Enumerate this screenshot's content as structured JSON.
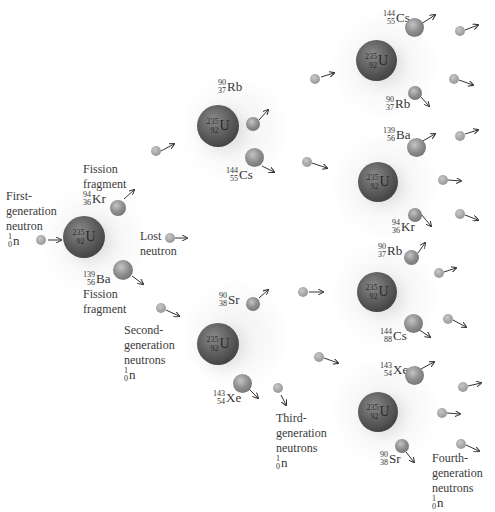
{
  "diagram": {
    "type": "nuclear-fission-chain-reaction",
    "uranium": {
      "mass": "235",
      "atomic": "92",
      "symbol": "U"
    },
    "neutron": {
      "mass": "1",
      "atomic": "0",
      "symbol": "n"
    },
    "labels": {
      "first_gen": [
        "First-",
        "generation",
        "neutron"
      ],
      "fission_fragment_top": [
        "Fission",
        "fragment"
      ],
      "fission_fragment_bottom": [
        "Fission",
        "fragment"
      ],
      "lost_neutron": [
        "Lost",
        "neutron"
      ],
      "second_gen": [
        "Second-",
        "generation",
        "neutrons"
      ],
      "third_gen": [
        "Third-",
        "generation",
        "neutrons"
      ],
      "fourth_gen": [
        "Fourth-",
        "generation",
        "neutrons"
      ]
    },
    "fragments": {
      "kr1": {
        "mass": "94",
        "atomic": "36",
        "symbol": "Kr"
      },
      "ba1": {
        "mass": "139",
        "atomic": "56",
        "symbol": "Ba"
      },
      "rb2": {
        "mass": "90",
        "atomic": "37",
        "symbol": "Rb"
      },
      "cs2": {
        "mass": "144",
        "atomic": "55",
        "symbol": "Cs"
      },
      "sr2": {
        "mass": "90",
        "atomic": "38",
        "symbol": "Sr"
      },
      "xe2": {
        "mass": "143",
        "atomic": "54",
        "symbol": "Xe"
      },
      "cs3a": {
        "mass": "144",
        "atomic": "55",
        "symbol": "Cs"
      },
      "rb3a": {
        "mass": "90",
        "atomic": "37",
        "symbol": "Rb"
      },
      "ba3b": {
        "mass": "139",
        "atomic": "56",
        "symbol": "Ba"
      },
      "kr3b": {
        "mass": "94",
        "atomic": "36",
        "symbol": "Kr"
      },
      "rb3c": {
        "mass": "90",
        "atomic": "37",
        "symbol": "Rb"
      },
      "cs3c": {
        "mass": "144",
        "atomic": "88",
        "symbol": "Cs"
      },
      "xe3d": {
        "mass": "143",
        "atomic": "54",
        "symbol": "Xe"
      },
      "sr3d": {
        "mass": "90",
        "atomic": "38",
        "symbol": "Sr"
      }
    },
    "colors": {
      "uranium": "#4a4a4a",
      "fragment": "#8e8e8e",
      "neutron": "#a0a0a0",
      "text": "#333333"
    }
  }
}
